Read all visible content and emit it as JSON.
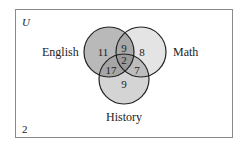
{
  "diagram": {
    "type": "venn",
    "universe_label": "U",
    "outside_count": "2",
    "sets": [
      {
        "name": "English",
        "color": "#b9b9b9"
      },
      {
        "name": "Math",
        "color": "#e4e4e4"
      },
      {
        "name": "History",
        "color": "#d4d4d4"
      }
    ],
    "regions": {
      "english_only": "11",
      "math_only": "8",
      "history_only": "9",
      "english_math_only": "9",
      "english_history_only": "17",
      "math_history_only": "7",
      "all_three": "2"
    }
  }
}
